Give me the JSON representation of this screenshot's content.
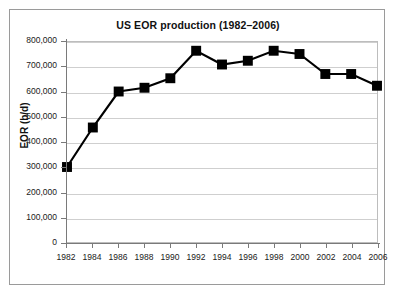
{
  "chart_data": {
    "type": "line",
    "title": "US EOR production (1982–2006)",
    "xlabel": "",
    "ylabel": "EOR (b/d)",
    "categories": [
      1982,
      1984,
      1986,
      1988,
      1990,
      1992,
      1994,
      1996,
      1998,
      2000,
      2002,
      2004,
      2006
    ],
    "values": [
      300000,
      458000,
      602000,
      617000,
      655000,
      765000,
      710000,
      725000,
      765000,
      752000,
      672000,
      672000,
      625000
    ],
    "series": [
      {
        "name": "US EOR production",
        "values": [
          300000,
          458000,
          602000,
          617000,
          655000,
          765000,
          710000,
          725000,
          765000,
          752000,
          672000,
          672000,
          625000
        ]
      }
    ],
    "xlim": [
      1982,
      2006
    ],
    "ylim": [
      0,
      800000
    ],
    "ytick_labels": [
      "800,000",
      "700,000",
      "600,000",
      "500,000",
      "400,000",
      "300,000",
      "200,000",
      "100,000",
      "0"
    ],
    "ytick_values": [
      800000,
      700000,
      600000,
      500000,
      400000,
      300000,
      200000,
      100000,
      0
    ],
    "xtick_labels": [
      "1982",
      "1984",
      "1986",
      "1988",
      "1990",
      "1992",
      "1994",
      "1996",
      "1998",
      "2000",
      "2002",
      "2004",
      "2006"
    ],
    "grid": "horizontal",
    "legend": "none",
    "marker": "square",
    "line_color": "#000000",
    "marker_color": "#000000",
    "grid_color": "#cfcfcf",
    "background_color": "#ffffff",
    "frame_color": "#9a9a9a"
  }
}
